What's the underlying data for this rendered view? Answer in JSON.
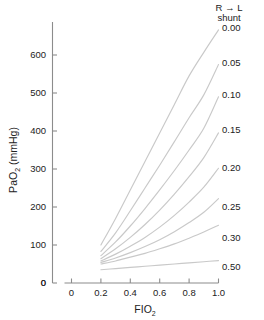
{
  "chart_data": {
    "type": "line",
    "title": "",
    "xlabel": "FIO2",
    "ylabel": "PaO2 (mmHg)",
    "xlabel_display": "FIO",
    "xlabel_sub": "2",
    "ylabel_display_a": "PaO",
    "ylabel_sub": "2",
    "ylabel_display_b": " (mmHg)",
    "xlim": [
      0,
      1.0
    ],
    "ylim": [
      0,
      680
    ],
    "grid": false,
    "legend_position": "right",
    "legend_title_line1": "R → L",
    "legend_title_line2": "shunt",
    "xticks": [
      0,
      0.2,
      0.4,
      0.6,
      0.8,
      1.0
    ],
    "xticklabels": [
      "0",
      "0.2",
      "0.4",
      "0.6",
      "0.8",
      "1.0"
    ],
    "yticks": [
      0,
      100,
      200,
      300,
      400,
      500,
      600
    ],
    "yticklabels": [
      "0",
      "100",
      "200",
      "300",
      "400",
      "500",
      "600"
    ],
    "x": [
      0.2,
      0.3,
      0.4,
      0.5,
      0.6,
      0.7,
      0.8,
      0.9,
      1.0
    ],
    "series": [
      {
        "name": "0.00",
        "label": "0.00",
        "values": [
          100,
          170,
          245,
          320,
          395,
          470,
          545,
          607,
          666
        ]
      },
      {
        "name": "0.05",
        "label": "0.05",
        "values": [
          83,
          132,
          190,
          250,
          310,
          372,
          435,
          495,
          575
        ]
      },
      {
        "name": "0.10",
        "label": "0.10",
        "values": [
          72,
          108,
          150,
          196,
          245,
          296,
          350,
          407,
          490
        ]
      },
      {
        "name": "0.15",
        "label": "0.15",
        "values": [
          64,
          90,
          120,
          154,
          192,
          234,
          280,
          330,
          395
        ]
      },
      {
        "name": "0.20",
        "label": "0.20",
        "values": [
          58,
          76,
          97,
          120,
          147,
          178,
          213,
          252,
          302
        ]
      },
      {
        "name": "0.25",
        "label": "0.25",
        "values": [
          54,
          66,
          80,
          96,
          114,
          135,
          159,
          186,
          222
        ]
      },
      {
        "name": "0.30",
        "label": "0.30",
        "values": [
          50,
          58,
          68,
          78,
          90,
          103,
          118,
          134,
          152
        ]
      },
      {
        "name": "0.50",
        "label": "0.50",
        "values": [
          35,
          38,
          41,
          44,
          47,
          50,
          53,
          56,
          59
        ]
      }
    ]
  }
}
